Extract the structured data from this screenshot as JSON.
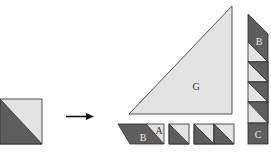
{
  "diagram": {
    "colors": {
      "dark": "#5e5e5e",
      "light": "#e3e3e3",
      "stroke": "#2a2a2a",
      "labelDark": "#e8e8e8",
      "labelLight": "#333333"
    },
    "source": {
      "name": "half-square-triangle block"
    },
    "arrow": {
      "direction": "right"
    },
    "labels": {
      "large_triangle": "G",
      "parallelogram_dark": "B",
      "parallelogram_light": "A",
      "strip_top": "B",
      "strip_bottom": "C"
    }
  }
}
